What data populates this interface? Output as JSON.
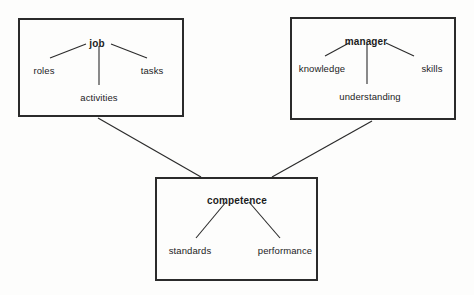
{
  "diagram": {
    "background_color": "#fdfdfc",
    "line_color": "#2b2b2b",
    "text_color": "#1c1c1c",
    "groups": [
      {
        "id": "job",
        "head": "job",
        "box": {
          "x": 18,
          "y": 18,
          "w": 166,
          "h": 99
        },
        "head_pos": {
          "x": 97,
          "y": 39
        },
        "children": [
          {
            "label": "roles",
            "x": 44,
            "y": 66
          },
          {
            "label": "tasks",
            "x": 152,
            "y": 66
          },
          {
            "label": "activities",
            "x": 99,
            "y": 93
          }
        ]
      },
      {
        "id": "manager",
        "head": "manager",
        "box": {
          "x": 290,
          "y": 17,
          "w": 166,
          "h": 103
        },
        "head_pos": {
          "x": 366,
          "y": 37
        },
        "children": [
          {
            "label": "knowledge",
            "x": 322,
            "y": 64
          },
          {
            "label": "skills",
            "x": 432,
            "y": 64
          },
          {
            "label": "understanding",
            "x": 370,
            "y": 92
          }
        ]
      },
      {
        "id": "competence",
        "head": "competence",
        "box": {
          "x": 155,
          "y": 177,
          "w": 163,
          "h": 104
        },
        "head_pos": {
          "x": 237,
          "y": 196
        },
        "children": [
          {
            "label": "standards",
            "x": 190,
            "y": 246
          },
          {
            "label": "performance",
            "x": 285,
            "y": 246
          }
        ]
      }
    ],
    "connectors": [
      {
        "id": "job-to-competence",
        "from": "job",
        "to": "competence",
        "x1": 98,
        "y1": 118,
        "x2": 201,
        "y2": 177
      },
      {
        "id": "manager-to-competence",
        "from": "manager",
        "to": "competence",
        "x1": 372,
        "y1": 121,
        "x2": 272,
        "y2": 177
      }
    ],
    "branches": [
      {
        "id": "job-roles",
        "x1": 86,
        "y1": 44,
        "x2": 50,
        "y2": 58
      },
      {
        "id": "job-activities",
        "x1": 99,
        "y1": 46,
        "x2": 99,
        "y2": 85
      },
      {
        "id": "job-tasks",
        "x1": 111,
        "y1": 44,
        "x2": 147,
        "y2": 58
      },
      {
        "id": "manager-knowledge",
        "x1": 349,
        "y1": 43,
        "x2": 325,
        "y2": 56
      },
      {
        "id": "manager-understanding",
        "x1": 367,
        "y1": 44,
        "x2": 367,
        "y2": 84
      },
      {
        "id": "manager-skills",
        "x1": 386,
        "y1": 43,
        "x2": 414,
        "y2": 56
      },
      {
        "id": "competence-standards",
        "x1": 226,
        "y1": 202,
        "x2": 196,
        "y2": 238
      },
      {
        "id": "competence-performance",
        "x1": 249,
        "y1": 202,
        "x2": 280,
        "y2": 238
      }
    ]
  }
}
